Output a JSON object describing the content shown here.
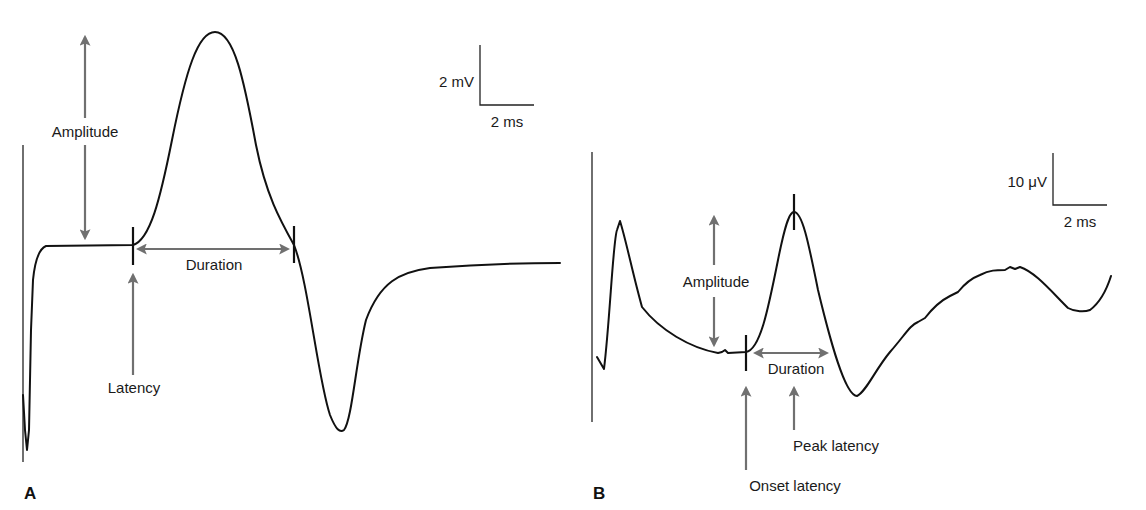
{
  "figure": {
    "panel_a": {
      "letter": "A",
      "scale_bar": {
        "vertical": "2 mV",
        "horizontal": "2 ms"
      },
      "labels": {
        "amplitude": "Amplitude",
        "duration": "Duration",
        "latency": "Latency"
      }
    },
    "panel_b": {
      "letter": "B",
      "scale_bar": {
        "vertical": "10 μV",
        "horizontal": "2 ms"
      },
      "labels": {
        "amplitude": "Amplitude",
        "duration": "Duration",
        "peak_latency": "Peak latency",
        "onset_latency": "Onset latency"
      }
    },
    "colors": {
      "trace": "#111111",
      "annotation_arrow": "#707070",
      "text": "#1a1a1a"
    }
  }
}
